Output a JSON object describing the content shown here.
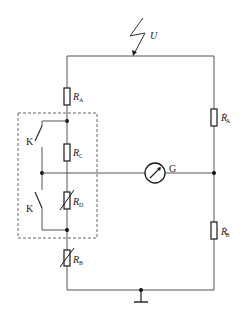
{
  "diagram": {
    "type": "circuit-schematic",
    "source": {
      "symbol": "lightning-arrow",
      "label": "U"
    },
    "galvanometer": {
      "label": "G"
    },
    "switches": [
      {
        "label": "K"
      },
      {
        "label": "K"
      }
    ],
    "resistors": {
      "RA": {
        "main": "R",
        "sub": "A",
        "prime": ""
      },
      "RC": {
        "main": "R",
        "sub": "C",
        "prime": ""
      },
      "RD": {
        "main": "R",
        "sub": "D",
        "prime": "",
        "variable": true
      },
      "RB": {
        "main": "R",
        "sub": "B",
        "prime": "",
        "variable": true
      },
      "RA_prime": {
        "main": "R",
        "sub": "A",
        "prime": "′"
      },
      "RB_prime": {
        "main": "R",
        "sub": "B",
        "prime": "′"
      }
    },
    "ground": {
      "symbol": "ground"
    },
    "colors": {
      "line": "#555555",
      "component": "#1a1a1a",
      "dashed_box": "#666666",
      "background": "#ffffff"
    }
  }
}
